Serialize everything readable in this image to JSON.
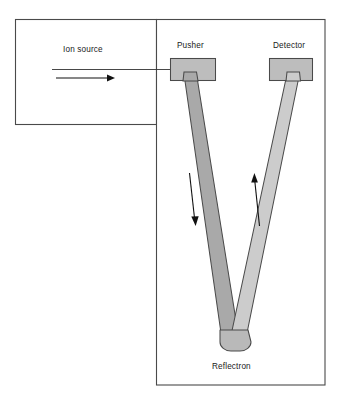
{
  "figure": {
    "type": "schematic-diagram",
    "background_color": "#ffffff"
  },
  "labels": {
    "ion_source": "Ion source",
    "pusher": "Pusher",
    "detector": "Detector",
    "reflectron": "Reflectron"
  },
  "colors": {
    "outline": "#4a4a4a",
    "arrow": "#111111",
    "electrode_fill": "#bdbdbd",
    "descending_arm_fill": "#a9a9a9",
    "ascending_arm_fill": "#cccccc",
    "text": "#1a1a1a"
  },
  "components": {
    "source_chamber": {
      "x": 15,
      "y": 19,
      "width": 141,
      "height": 105
    },
    "analyser_chamber": {
      "x": 156,
      "y": 19,
      "width": 169,
      "height": 366
    },
    "pusher_electrode": {
      "x": 170,
      "y": 58,
      "width": 46,
      "height": 23
    },
    "detector_electrode": {
      "x": 269,
      "y": 58,
      "width": 44,
      "height": 23
    },
    "reflectron_apex": {
      "x": 230,
      "y": 346
    }
  },
  "arrows": {
    "ion_beam": {
      "direction": "right",
      "from_x": 56,
      "to_x": 113,
      "y": 78
    },
    "descending_flight": {
      "direction": "down",
      "label": "ions travel toward reflectron"
    },
    "ascending_flight": {
      "direction": "up",
      "label": "ions travel toward detector"
    }
  }
}
